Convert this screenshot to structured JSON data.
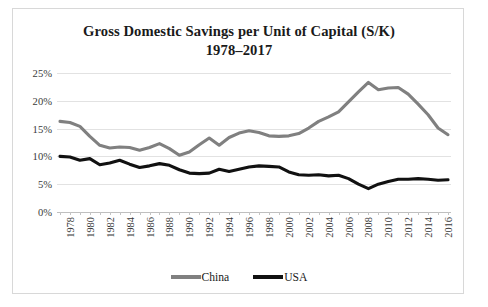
{
  "chart_data": {
    "type": "line",
    "title": "Gross Domestic Savings per Unit of Capital (S/K)",
    "subtitle": "1978–2017",
    "xlabel": "",
    "ylabel": "",
    "ylim": [
      0,
      25
    ],
    "ytick_labels": [
      "25%",
      "20%",
      "15%",
      "10%",
      "5%",
      "0%"
    ],
    "ytick_values": [
      25,
      20,
      15,
      10,
      5,
      0
    ],
    "grid": true,
    "legend_position": "bottom-center",
    "x": [
      1978,
      1979,
      1980,
      1981,
      1982,
      1983,
      1984,
      1985,
      1986,
      1987,
      1988,
      1989,
      1990,
      1991,
      1992,
      1993,
      1994,
      1995,
      1996,
      1997,
      1998,
      1999,
      2000,
      2001,
      2002,
      2003,
      2004,
      2005,
      2006,
      2007,
      2008,
      2009,
      2010,
      2011,
      2012,
      2013,
      2014,
      2015,
      2016,
      2017
    ],
    "xtick_labels": [
      "1978",
      "1980",
      "1982",
      "1984",
      "1986",
      "1988",
      "1990",
      "1992",
      "1994",
      "1996",
      "1998",
      "2000",
      "2002",
      "2004",
      "2006",
      "2008",
      "2010",
      "2012",
      "2014",
      "2016"
    ],
    "series": [
      {
        "name": "China",
        "color": "#808080",
        "values": [
          16.3,
          16.1,
          15.4,
          13.6,
          12.0,
          11.5,
          11.7,
          11.6,
          11.1,
          11.6,
          12.3,
          11.4,
          10.2,
          10.8,
          12.1,
          13.3,
          12.0,
          13.4,
          14.2,
          14.6,
          14.3,
          13.7,
          13.6,
          13.7,
          14.1,
          15.1,
          16.3,
          17.1,
          18.0,
          19.8,
          21.6,
          23.3,
          22.0,
          22.3,
          22.4,
          21.2,
          19.4,
          17.5,
          15.1,
          13.9
        ]
      },
      {
        "name": "USA",
        "color": "#111111",
        "values": [
          10.0,
          9.9,
          9.3,
          9.6,
          8.5,
          8.8,
          9.3,
          8.6,
          8.0,
          8.3,
          8.7,
          8.4,
          7.6,
          7.0,
          6.9,
          7.0,
          7.7,
          7.3,
          7.7,
          8.1,
          8.3,
          8.2,
          8.1,
          7.2,
          6.7,
          6.6,
          6.7,
          6.5,
          6.6,
          6.0,
          5.0,
          4.2,
          5.0,
          5.5,
          5.9,
          5.9,
          6.0,
          5.9,
          5.7,
          5.8
        ]
      }
    ],
    "legend": [
      {
        "label": "China",
        "color": "#808080"
      },
      {
        "label": "USA",
        "color": "#111111"
      }
    ]
  }
}
